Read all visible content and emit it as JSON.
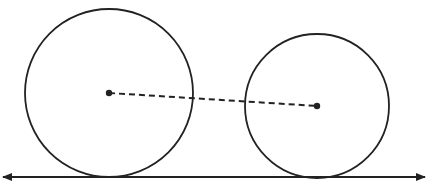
{
  "diagram": {
    "width": 428,
    "height": 196,
    "stroke_color": "#222222",
    "background": "#ffffff",
    "circles": [
      {
        "name": "large-circle",
        "cx": 109,
        "cy": 93,
        "r": 84
      },
      {
        "name": "small-circle",
        "cx": 317,
        "cy": 106,
        "r": 72
      }
    ],
    "center_points": [
      {
        "name": "large-circle-center",
        "x": 109,
        "y": 93,
        "r": 3.2
      },
      {
        "name": "small-circle-center",
        "x": 317,
        "y": 106,
        "r": 3.2
      }
    ],
    "connector": {
      "x1": 109,
      "y1": 93,
      "x2": 317,
      "y2": 106,
      "dash": "6,4"
    },
    "ground_line": {
      "x1": 3,
      "y1": 177,
      "x2": 425,
      "y2": 177,
      "arrows": "both"
    }
  }
}
